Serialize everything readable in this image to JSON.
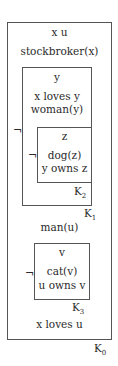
{
  "diagram": {
    "type": "DRS box diagram",
    "K0": {
      "label": "K",
      "label_sub": "0",
      "referents": "x u",
      "conditions": [
        "stockbroker(x)",
        "man(u)",
        "x loves u"
      ]
    },
    "K1": {
      "label": "K",
      "label_sub": "1",
      "negation": "¬",
      "referents": "y",
      "conditions": [
        "x loves y",
        "woman(y)"
      ]
    },
    "K2": {
      "label": "K",
      "label_sub": "2",
      "negation": "¬",
      "referents": "z",
      "conditions": [
        "dog(z)",
        "y owns z"
      ]
    },
    "K3": {
      "label": "K",
      "label_sub": "3",
      "negation": "¬",
      "referents": "v",
      "conditions": [
        "cat(v)",
        "u owns v"
      ]
    }
  }
}
